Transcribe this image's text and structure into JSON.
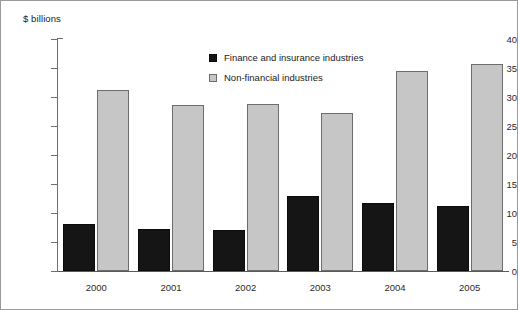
{
  "chart_data": {
    "type": "bar",
    "title": "",
    "subtitle": "",
    "xlabel": "",
    "ylabel": "$ billions",
    "categories": [
      "2000",
      "2001",
      "2002",
      "2003",
      "2004",
      "2005"
    ],
    "series": [
      {
        "name": "Finance and insurance industries",
        "color": "#151515",
        "values": [
          8.1,
          7.2,
          7.0,
          12.9,
          11.7,
          11.2
        ]
      },
      {
        "name": "Non-financial industries",
        "color": "#c6c6c6",
        "values": [
          31.2,
          28.6,
          28.8,
          27.3,
          34.5,
          35.7
        ]
      }
    ],
    "ylim": [
      0,
      40
    ],
    "ytick_step": 5,
    "ytick_labels": [
      "40",
      "35",
      "30",
      "25",
      "20",
      "15",
      "10",
      "5",
      "0"
    ],
    "grid": false,
    "legend_position": "inside-top-center"
  },
  "legend": {
    "items": [
      {
        "label": "Finance and insurance industries",
        "swatch": "dark-square-icon"
      },
      {
        "label": "Non-financial industries",
        "swatch": "light-square-icon"
      }
    ]
  },
  "axis": {
    "y_title": "$ billions"
  }
}
